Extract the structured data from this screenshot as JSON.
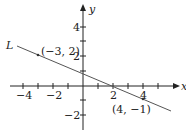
{
  "diagram": {
    "type": "coordinate-plane-line",
    "axes": {
      "x_label": "x",
      "y_label": "y",
      "x_ticks": [
        {
          "value": -4,
          "label": "−4"
        },
        {
          "value": -3,
          "label": ""
        },
        {
          "value": -2,
          "label": "−2"
        },
        {
          "value": -1,
          "label": ""
        },
        {
          "value": 1,
          "label": ""
        },
        {
          "value": 2,
          "label": "2"
        },
        {
          "value": 3,
          "label": ""
        },
        {
          "value": 4,
          "label": "4"
        },
        {
          "value": 5,
          "label": ""
        }
      ],
      "y_ticks": [
        {
          "value": 4,
          "label": "4"
        },
        {
          "value": 3,
          "label": ""
        },
        {
          "value": 2,
          "label": "2"
        },
        {
          "value": 1,
          "label": ""
        },
        {
          "value": -1,
          "label": ""
        },
        {
          "value": -2,
          "label": "−2"
        }
      ]
    },
    "line": {
      "name": "L",
      "points": [
        {
          "x": -3,
          "y": 2,
          "label": "(−3, 2)"
        },
        {
          "x": 4,
          "y": -1,
          "label": "(4, −1)"
        }
      ],
      "slope": "-3/7"
    },
    "colors": {
      "axis": "#222222",
      "line": "#555555"
    }
  }
}
